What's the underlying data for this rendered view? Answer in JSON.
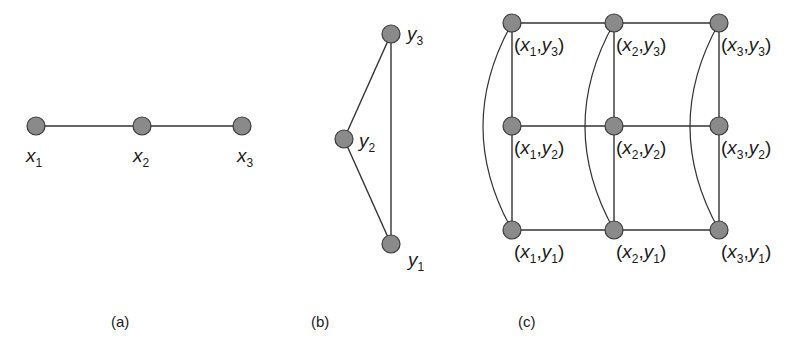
{
  "figure": {
    "panels": [
      {
        "id": "a",
        "caption": "(a)",
        "nodes": [
          {
            "id": "x1",
            "var": "x",
            "sub": "1",
            "cx": 36,
            "cy": 126
          },
          {
            "id": "x2",
            "var": "x",
            "sub": "2",
            "cx": 142,
            "cy": 126
          },
          {
            "id": "x3",
            "var": "x",
            "sub": "3",
            "cx": 242,
            "cy": 126
          }
        ],
        "edges": [
          [
            "x1",
            "x2"
          ],
          [
            "x2",
            "x3"
          ]
        ]
      },
      {
        "id": "b",
        "caption": "(b)",
        "nodes": [
          {
            "id": "y3",
            "var": "y",
            "sub": "3",
            "cx": 391,
            "cy": 34
          },
          {
            "id": "y2",
            "var": "y",
            "sub": "2",
            "cx": 344,
            "cy": 139
          },
          {
            "id": "y1",
            "var": "y",
            "sub": "1",
            "cx": 391,
            "cy": 244
          }
        ],
        "edges": [
          [
            "y3",
            "y2"
          ],
          [
            "y2",
            "y1"
          ],
          [
            "y3",
            "y1"
          ]
        ]
      },
      {
        "id": "c",
        "caption": "(c)",
        "nodes": [
          {
            "id": "x1y3",
            "label": [
              "x",
              "1",
              "y",
              "3"
            ],
            "cx": 512,
            "cy": 23
          },
          {
            "id": "x2y3",
            "label": [
              "x",
              "2",
              "y",
              "3"
            ],
            "cx": 614,
            "cy": 23
          },
          {
            "id": "x3y3",
            "label": [
              "x",
              "3",
              "y",
              "3"
            ],
            "cx": 719,
            "cy": 23
          },
          {
            "id": "x1y2",
            "label": [
              "x",
              "1",
              "y",
              "2"
            ],
            "cx": 512,
            "cy": 126
          },
          {
            "id": "x2y2",
            "label": [
              "x",
              "2",
              "y",
              "2"
            ],
            "cx": 614,
            "cy": 126
          },
          {
            "id": "x3y2",
            "label": [
              "x",
              "3",
              "y",
              "2"
            ],
            "cx": 719,
            "cy": 126
          },
          {
            "id": "x1y1",
            "label": [
              "x",
              "1",
              "y",
              "1"
            ],
            "cx": 512,
            "cy": 230
          },
          {
            "id": "x2y1",
            "label": [
              "x",
              "2",
              "y",
              "1"
            ],
            "cx": 614,
            "cy": 230
          },
          {
            "id": "x3y1",
            "label": [
              "x",
              "3",
              "y",
              "1"
            ],
            "cx": 719,
            "cy": 230
          }
        ],
        "edges": [
          [
            "x1y3",
            "x2y3"
          ],
          [
            "x2y3",
            "x3y3"
          ],
          [
            "x1y2",
            "x2y2"
          ],
          [
            "x2y2",
            "x3y2"
          ],
          [
            "x1y1",
            "x2y1"
          ],
          [
            "x2y1",
            "x3y1"
          ],
          [
            "x1y3",
            "x1y2"
          ],
          [
            "x1y2",
            "x1y1"
          ],
          [
            "x2y3",
            "x2y2"
          ],
          [
            "x2y2",
            "x2y1"
          ],
          [
            "x3y3",
            "x3y2"
          ],
          [
            "x3y2",
            "x3y1"
          ]
        ],
        "curved_edges": [
          [
            "x1y3",
            "x1y1"
          ],
          [
            "x2y3",
            "x2y1"
          ],
          [
            "x3y3",
            "x3y1"
          ]
        ]
      }
    ],
    "colors": {
      "node_fill": "#8a8a8a",
      "node_stroke": "#3a3a3a",
      "edge": "#333333",
      "text": "#1a1a1a"
    }
  }
}
